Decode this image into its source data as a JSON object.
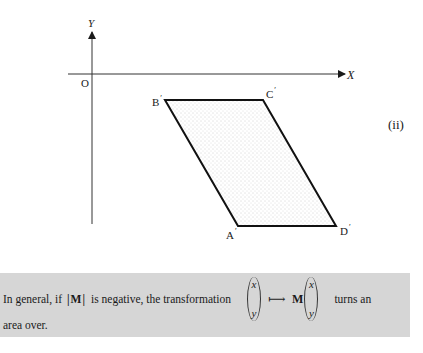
{
  "figure": {
    "panel_label": "(ii)",
    "axes": {
      "x_label": "X",
      "y_label": "Y",
      "origin_label": "O"
    },
    "shape": {
      "type": "parallelogram",
      "fill": "stippled dots",
      "vertices": [
        {
          "name": "A",
          "prime": "′",
          "x": 238,
          "y": 226
        },
        {
          "name": "B",
          "prime": "′",
          "x": 165,
          "y": 100
        },
        {
          "name": "C",
          "prime": "′",
          "x": 263,
          "y": 100
        },
        {
          "name": "D",
          "prime": "′",
          "x": 336,
          "y": 226
        }
      ]
    }
  },
  "note": {
    "text_before_det": "In general, if",
    "det_expression": "|M|",
    "text_after_det": "is negative, the transformation",
    "vector_top": "x",
    "vector_bottom": "y",
    "mapsto_symbol": "⟼",
    "matrix_symbol": "M",
    "text_end": "turns an",
    "line2": "area over.",
    "background_color": "#d6d6d6"
  }
}
